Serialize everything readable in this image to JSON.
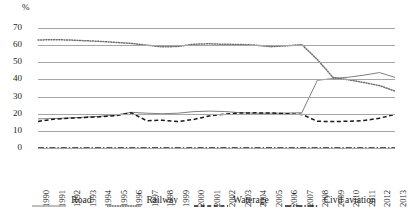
{
  "chart_data": {
    "type": "line",
    "title": "",
    "subtitle": "",
    "xlabel": "",
    "ylabel": "%",
    "ylim": [
      0,
      70
    ],
    "yticks": [
      0,
      10,
      20,
      30,
      40,
      50,
      60,
      70
    ],
    "grid": true,
    "legend_position": "bottom",
    "categories": [
      "1990",
      "1991",
      "1992",
      "1993",
      "1994",
      "1995",
      "1996",
      "1997",
      "1998",
      "1999",
      "2000",
      "2001",
      "2002",
      "2003",
      "2004",
      "2005",
      "2006",
      "2007",
      "2008",
      "2009",
      "2010",
      "2011",
      "2012",
      "2013"
    ],
    "series": [
      {
        "name": "Road",
        "style": "solid",
        "color": "#808080",
        "values": [
          17.0,
          17.2,
          17.5,
          18.0,
          18.5,
          19.2,
          20.8,
          20.3,
          20.0,
          20.3,
          21.2,
          21.5,
          21.3,
          20.6,
          20.3,
          20.3,
          20.4,
          20.6,
          39.5,
          40.5,
          41.3,
          42.5,
          44.0,
          41.2
        ]
      },
      {
        "name": "Railway",
        "style": "dotted",
        "color": "#6e6e6e",
        "values": [
          63.0,
          63.2,
          63.0,
          62.6,
          62.2,
          61.6,
          61.0,
          60.0,
          59.0,
          59.2,
          60.5,
          60.8,
          60.5,
          60.4,
          60.0,
          59.1,
          59.6,
          60.3,
          51.6,
          41.2,
          39.8,
          38.2,
          36.4,
          33.2
        ]
      },
      {
        "name": "Waterage",
        "style": "dashed",
        "color": "#1a1a1a",
        "values": [
          15.5,
          16.8,
          17.4,
          17.8,
          18.2,
          18.8,
          20.6,
          15.9,
          16.2,
          15.4,
          16.6,
          18.6,
          19.7,
          20.4,
          20.5,
          20.4,
          20.0,
          19.6,
          15.6,
          15.4,
          15.6,
          16.0,
          17.4,
          19.6
        ]
      },
      {
        "name": "Civil aviation",
        "style": "dash-dot",
        "color": "#1a1a1a",
        "values": [
          0.0,
          0.0,
          0.0,
          0.0,
          0.0,
          0.0,
          0.0,
          0.0,
          0.0,
          0.0,
          0.0,
          0.0,
          0.0,
          0.0,
          0.0,
          0.0,
          0.0,
          0.0,
          0.0,
          0.0,
          0.0,
          0.0,
          0.0,
          0.0
        ]
      }
    ]
  },
  "axis": {
    "unit_label": "%"
  },
  "legend": {
    "items": [
      {
        "label": "Road"
      },
      {
        "label": "Railway"
      },
      {
        "label": "Waterage"
      },
      {
        "label": "Civil aviation"
      }
    ]
  }
}
